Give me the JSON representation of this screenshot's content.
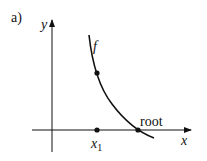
{
  "figure": {
    "panel_label": "a)",
    "y_axis_label": "y",
    "x_axis_label": "x",
    "curve_label": "f",
    "root_label": "root",
    "x1_label": "x",
    "x1_subscript": "1",
    "colors": {
      "ink": "#111111",
      "background": "#ffffff"
    }
  }
}
